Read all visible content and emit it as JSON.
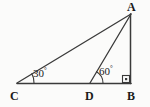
{
  "figure": {
    "kind": "geometry-diagram",
    "background_color": "#fbfbfa",
    "stroke_color": "#3a3a3a",
    "text_color": "#1a1a1a",
    "width": 150,
    "height": 107
  },
  "vertices": [
    {
      "id": "A",
      "label": "A",
      "x": 131,
      "y": 14
    },
    {
      "id": "B",
      "label": "B",
      "x": 131,
      "y": 83
    },
    {
      "id": "C",
      "label": "C",
      "x": 17,
      "y": 83
    },
    {
      "id": "D",
      "label": "D",
      "x": 90,
      "y": 83
    }
  ],
  "segments": [
    {
      "id": "CB",
      "from": "C",
      "to": "B"
    },
    {
      "id": "CA",
      "from": "C",
      "to": "A"
    },
    {
      "id": "DA",
      "from": "D",
      "to": "A"
    },
    {
      "id": "AB",
      "from": "A",
      "to": "B"
    }
  ],
  "angles": [
    {
      "id": "angle-C",
      "at": "C",
      "value": "30",
      "degree_symbol": "°",
      "arc_radius": 17
    },
    {
      "id": "angle-D",
      "at": "D",
      "value": "60",
      "degree_symbol": "°",
      "arc_radius": 13
    }
  ],
  "right_angle": {
    "id": "right-angle-B",
    "at": "B",
    "marker": "square-with-dot",
    "size": 7
  }
}
